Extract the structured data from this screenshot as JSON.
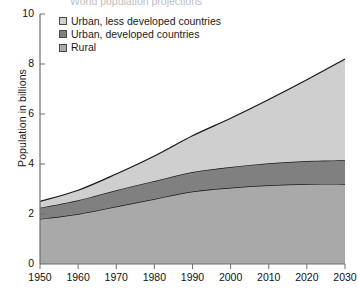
{
  "chart": {
    "title": "World population projections",
    "ylabel": "Population in billions",
    "xlabel": ""
  },
  "legend": {
    "items": [
      {
        "label": "Urban, less developed countries",
        "color": "#cfcfcf",
        "key": "urban_less_developed"
      },
      {
        "label": "Urban, developed countries",
        "color": "#808080",
        "key": "urban_developed"
      },
      {
        "label": "Rural",
        "color": "#a9a9a9",
        "key": "rural"
      }
    ]
  },
  "axes": {
    "y_ticks": [
      "0",
      "2",
      "4",
      "6",
      "8",
      "10"
    ],
    "x_ticks": [
      "1950",
      "1960",
      "1970",
      "1980",
      "1990",
      "2000",
      "2010",
      "2020",
      "2030"
    ]
  },
  "chart_data": {
    "type": "area",
    "stacked": true,
    "title": "World population projections",
    "xlabel": "",
    "ylabel": "Population in billions",
    "xlim": [
      1950,
      2030
    ],
    "ylim": [
      0,
      10
    ],
    "grid": false,
    "legend_position": "top-left",
    "x": [
      1950,
      1960,
      1970,
      1980,
      1990,
      2000,
      2010,
      2020,
      2030
    ],
    "series": [
      {
        "name": "Rural",
        "color": "#a9a9a9",
        "values": [
          1.8,
          2.0,
          2.3,
          2.6,
          2.9,
          3.05,
          3.15,
          3.2,
          3.2
        ]
      },
      {
        "name": "Urban, developed countries",
        "color": "#808080",
        "values": [
          0.45,
          0.55,
          0.65,
          0.72,
          0.78,
          0.83,
          0.88,
          0.92,
          0.95
        ]
      },
      {
        "name": "Urban, less developed countries",
        "color": "#cfcfcf",
        "values": [
          0.25,
          0.4,
          0.65,
          1.0,
          1.45,
          1.95,
          2.55,
          3.25,
          4.05
        ]
      }
    ],
    "cumulative": {
      "rural": [
        1.8,
        2.0,
        2.3,
        2.6,
        2.9,
        3.05,
        3.15,
        3.2,
        3.2
      ],
      "rural_plus_urban_developed": [
        2.25,
        2.55,
        2.95,
        3.32,
        3.68,
        3.88,
        4.03,
        4.12,
        4.15
      ],
      "total": [
        2.5,
        2.95,
        3.6,
        4.32,
        5.13,
        5.83,
        6.58,
        7.37,
        8.2
      ]
    }
  }
}
